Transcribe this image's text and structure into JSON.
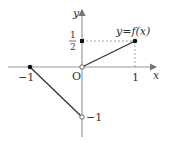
{
  "diagram": {
    "type": "function-graph",
    "function_label": "y=f(x)",
    "axes": {
      "x_label": "x",
      "y_label": "y",
      "origin_label": "O"
    },
    "tick_labels": {
      "x_neg1": "−1",
      "x_pos1": "1",
      "y_neg1": "−1",
      "y_half_num": "1",
      "y_half_den": "2"
    },
    "points": [
      {
        "x": -1,
        "y": 0,
        "style": "filled"
      },
      {
        "x": 0,
        "y": -1,
        "style": "open"
      },
      {
        "x": 0,
        "y": 0,
        "style": "open"
      },
      {
        "x": 1,
        "y": 0.5,
        "style": "filled"
      },
      {
        "x": 0,
        "y": 0.5,
        "style": "filled"
      }
    ],
    "segments": [
      {
        "from": [
          -1,
          0
        ],
        "to": [
          0,
          -1
        ]
      },
      {
        "from": [
          0,
          0
        ],
        "to": [
          1,
          0.5
        ]
      }
    ],
    "guides": [
      {
        "from": [
          0,
          0.5
        ],
        "to": [
          1,
          0.5
        ],
        "style": "dashed"
      },
      {
        "from": [
          1,
          0.5
        ],
        "to": [
          1,
          0
        ],
        "style": "dashed"
      }
    ],
    "colors": {
      "axis": "#999999",
      "line": "#333333",
      "point": "#111111"
    }
  }
}
